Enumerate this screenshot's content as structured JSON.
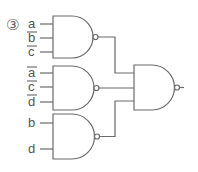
{
  "problem_number": "③",
  "colors": {
    "stroke": "#6a6a6a",
    "text": "#555555"
  },
  "gates": [
    {
      "id": "nand1",
      "type": "NAND",
      "inputs": [
        {
          "label": "a",
          "negated": false
        },
        {
          "label": "b",
          "negated": true
        },
        {
          "label": "c",
          "negated": true
        }
      ]
    },
    {
      "id": "nand2",
      "type": "NAND",
      "inputs": [
        {
          "label": "a",
          "negated": true
        },
        {
          "label": "c",
          "negated": true
        },
        {
          "label": "d",
          "negated": true
        }
      ]
    },
    {
      "id": "nand3",
      "type": "NAND",
      "inputs": [
        {
          "label": "b",
          "negated": false
        },
        {
          "label": "d",
          "negated": false
        }
      ]
    },
    {
      "id": "nand4",
      "type": "NAND",
      "inputs": [
        {
          "label": "nand1 output"
        },
        {
          "label": "nand2 output"
        },
        {
          "label": "nand3 output"
        }
      ]
    }
  ]
}
